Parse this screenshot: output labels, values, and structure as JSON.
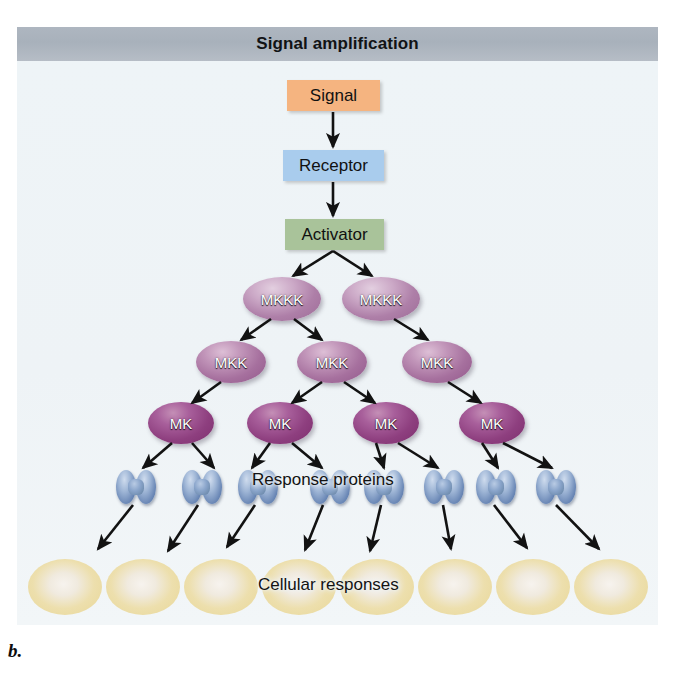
{
  "figure": {
    "title": "Signal amplification",
    "caption": "b."
  },
  "colors": {
    "title_bar": "#aeb6c0",
    "panel_bg": "#eef3f6",
    "signal_box": "#f5b480",
    "receptor_box": "#a9cced",
    "activator_box": "#a9c39a",
    "mkkk_oval": "#b385ac",
    "mkk_oval": "#a6709e",
    "mk_oval": "#8e3f7f",
    "response_protein": "#7b9ac4",
    "cellular_response": "#e8d182",
    "arrow": "#121212"
  },
  "nodes": {
    "signal": {
      "label": "Signal",
      "x": 287,
      "y": 80,
      "w": 93,
      "h": 31
    },
    "receptor": {
      "label": "Receptor",
      "x": 283,
      "y": 150,
      "w": 101,
      "h": 31
    },
    "activator": {
      "label": "Activator",
      "x": 285,
      "y": 219,
      "w": 99,
      "h": 31
    }
  },
  "tiers": {
    "mkkk": {
      "label": "MKKK",
      "count": 2,
      "ovals": [
        {
          "label": "MKKK",
          "cx": 282,
          "cy": 299,
          "rx": 39,
          "ry": 22
        },
        {
          "label": "MKKK",
          "cx": 381,
          "cy": 299,
          "rx": 39,
          "ry": 22
        }
      ]
    },
    "mkk": {
      "label": "MKK",
      "count": 3,
      "ovals": [
        {
          "label": "MKK",
          "cx": 231,
          "cy": 362,
          "rx": 35,
          "ry": 21
        },
        {
          "label": "MKK",
          "cx": 332,
          "cy": 362,
          "rx": 35,
          "ry": 21
        },
        {
          "label": "MKK",
          "cx": 437,
          "cy": 362,
          "rx": 35,
          "ry": 21
        }
      ]
    },
    "mk": {
      "label": "MK",
      "count": 4,
      "ovals": [
        {
          "label": "MK",
          "cx": 181,
          "cy": 423,
          "rx": 33,
          "ry": 21
        },
        {
          "label": "MK",
          "cx": 280,
          "cy": 423,
          "rx": 33,
          "ry": 21
        },
        {
          "label": "MK",
          "cx": 386,
          "cy": 423,
          "rx": 33,
          "ry": 21
        },
        {
          "label": "MK",
          "cx": 492,
          "cy": 423,
          "rx": 33,
          "ry": 21
        }
      ]
    },
    "response_proteins": {
      "label": "Response proteins",
      "label_x": 252,
      "label_y": 481,
      "count": 8,
      "items": [
        {
          "cx": 136,
          "cy": 487
        },
        {
          "cx": 202,
          "cy": 487
        },
        {
          "cx": 258,
          "cy": 487
        },
        {
          "cx": 330,
          "cy": 487
        },
        {
          "cx": 384,
          "cy": 487
        },
        {
          "cx": 444,
          "cy": 487
        },
        {
          "cx": 496,
          "cy": 487
        },
        {
          "cx": 556,
          "cy": 487
        }
      ]
    },
    "cellular_responses": {
      "label": "Cellular responses",
      "label_x": 258,
      "label_y": 586,
      "count": 8,
      "items": [
        {
          "cx": 65,
          "cy": 587
        },
        {
          "cx": 143,
          "cy": 587
        },
        {
          "cx": 221,
          "cy": 587
        },
        {
          "cx": 299,
          "cy": 587
        },
        {
          "cx": 377,
          "cy": 587
        },
        {
          "cx": 455,
          "cy": 587
        },
        {
          "cx": 533,
          "cy": 587
        },
        {
          "cx": 611,
          "cy": 587
        }
      ]
    }
  },
  "arrows": [
    {
      "name": "signal-to-receptor",
      "x1": 333,
      "y1": 112,
      "x2": 333,
      "y2": 147
    },
    {
      "name": "receptor-to-activator",
      "x1": 333,
      "y1": 182,
      "x2": 333,
      "y2": 216
    },
    {
      "name": "activator-to-mkkk-1",
      "x1": 333,
      "y1": 251,
      "x2": 293,
      "y2": 276
    },
    {
      "name": "activator-to-mkkk-2",
      "x1": 333,
      "y1": 251,
      "x2": 372,
      "y2": 276
    },
    {
      "name": "mkkk1-to-mkk1",
      "x1": 271,
      "y1": 319,
      "x2": 241,
      "y2": 340
    },
    {
      "name": "mkkk1-to-mkk2",
      "x1": 294,
      "y1": 319,
      "x2": 322,
      "y2": 340
    },
    {
      "name": "mkkk2-to-mkk3",
      "x1": 394,
      "y1": 319,
      "x2": 428,
      "y2": 340
    },
    {
      "name": "mkk1-to-mk1",
      "x1": 221,
      "y1": 382,
      "x2": 192,
      "y2": 403
    },
    {
      "name": "mkk2-to-mk2",
      "x1": 322,
      "y1": 382,
      "x2": 292,
      "y2": 403
    },
    {
      "name": "mkk2-to-mk3",
      "x1": 344,
      "y1": 382,
      "x2": 375,
      "y2": 403
    },
    {
      "name": "mkk3-to-mk4",
      "x1": 448,
      "y1": 382,
      "x2": 481,
      "y2": 403
    },
    {
      "name": "mk1-to-protein1",
      "x1": 172,
      "y1": 443,
      "x2": 143,
      "y2": 468
    },
    {
      "name": "mk1-to-protein2",
      "x1": 192,
      "y1": 443,
      "x2": 214,
      "y2": 468
    },
    {
      "name": "mk2-to-protein3",
      "x1": 270,
      "y1": 443,
      "x2": 252,
      "y2": 468
    },
    {
      "name": "mk2-to-protein4",
      "x1": 292,
      "y1": 443,
      "x2": 322,
      "y2": 468
    },
    {
      "name": "mk3-to-protein5",
      "x1": 376,
      "y1": 443,
      "x2": 384,
      "y2": 468
    },
    {
      "name": "mk3-to-protein6",
      "x1": 398,
      "y1": 443,
      "x2": 438,
      "y2": 468
    },
    {
      "name": "mk4-to-protein7",
      "x1": 482,
      "y1": 443,
      "x2": 498,
      "y2": 468
    },
    {
      "name": "mk4-to-protein8",
      "x1": 503,
      "y1": 443,
      "x2": 552,
      "y2": 468
    },
    {
      "name": "protein1-to-response1",
      "x1": 133,
      "y1": 505,
      "x2": 98,
      "y2": 549
    },
    {
      "name": "protein2-to-response2",
      "x1": 198,
      "y1": 505,
      "x2": 168,
      "y2": 551
    },
    {
      "name": "protein3-to-response3",
      "x1": 255,
      "y1": 505,
      "x2": 227,
      "y2": 547
    },
    {
      "name": "protein4-to-response4",
      "x1": 323,
      "y1": 505,
      "x2": 305,
      "y2": 550
    },
    {
      "name": "protein5-to-response5",
      "x1": 381,
      "y1": 505,
      "x2": 370,
      "y2": 551
    },
    {
      "name": "protein6-to-response6",
      "x1": 443,
      "y1": 505,
      "x2": 451,
      "y2": 549
    },
    {
      "name": "protein7-to-response7",
      "x1": 494,
      "y1": 505,
      "x2": 527,
      "y2": 548
    },
    {
      "name": "protein8-to-response8",
      "x1": 556,
      "y1": 505,
      "x2": 599,
      "y2": 549
    }
  ]
}
